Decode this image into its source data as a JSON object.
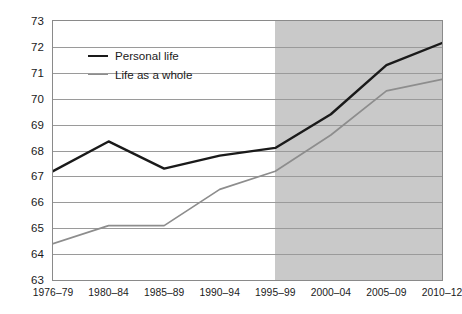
{
  "chart_data": {
    "type": "line",
    "title": "",
    "subtitle": "",
    "xlabel": "",
    "ylabel": "",
    "categories": [
      "1976–79",
      "1980–84",
      "1985–89",
      "1990–94",
      "1995–99",
      "2000–04",
      "2005–09",
      "2010–12"
    ],
    "series": [
      {
        "name": "Personal life",
        "color": "#1a1a1a",
        "values": [
          67.2,
          68.35,
          67.3,
          67.8,
          68.1,
          69.4,
          71.3,
          72.15
        ]
      },
      {
        "name": "Life as a whole",
        "color": "#8d8d8d",
        "values": [
          64.4,
          65.1,
          65.1,
          66.5,
          67.2,
          68.6,
          70.3,
          70.75
        ]
      }
    ],
    "ylim": [
      63,
      73
    ],
    "yticks": [
      63,
      64,
      65,
      66,
      67,
      68,
      69,
      70,
      71,
      72,
      73
    ],
    "ytick_labels": [
      "63",
      "64",
      "65",
      "66",
      "67",
      "68",
      "69",
      "70",
      "71",
      "72",
      "73"
    ],
    "grid": true,
    "grid_axis": "y",
    "legend_position": "upper-left-inside",
    "shaded_region": {
      "from_category": "1995–99",
      "to_category": "2010–12",
      "color": "#c9c9c9"
    },
    "plot_background": "#ffffff",
    "frame_color": "#8a8a8a"
  },
  "legend": {
    "items": [
      {
        "label": "Personal life"
      },
      {
        "label": "Life as a whole"
      }
    ]
  }
}
